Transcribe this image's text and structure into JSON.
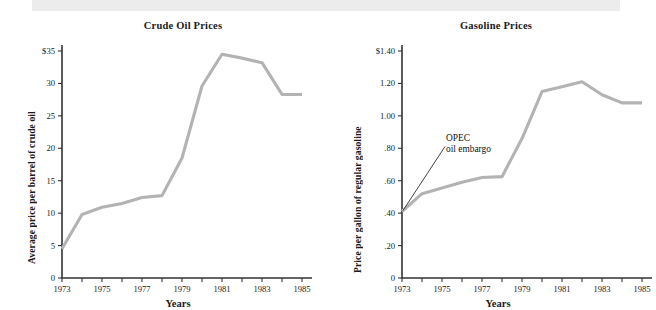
{
  "figure": {
    "background_color": "#ffffff",
    "band_color": "#ececec",
    "line_color": "#b3b3b3",
    "axis_color": "#333333"
  },
  "charts": [
    {
      "id": "crude-oil-prices",
      "title": "Crude Oil Prices",
      "xlabel": "Years",
      "ylabel": "Average price per barrel of crude oil",
      "ytick_labels": [
        "0",
        "5",
        "10",
        "15",
        "20",
        "25",
        "30",
        "$35"
      ],
      "xtick_labels": [
        "1973",
        "1975",
        "1977",
        "1979",
        "1981",
        "1983",
        "1985"
      ]
    },
    {
      "id": "gasoline-prices",
      "title": "Gasoline Prices",
      "xlabel": "Years",
      "ylabel": "Price per gallon of regular gasoline",
      "ytick_labels": [
        "0",
        ".20",
        ".40",
        ".60",
        ".80",
        "1.00",
        "1.20",
        "$1.40"
      ],
      "xtick_labels": [
        "1973",
        "1975",
        "1977",
        "1979",
        "1981",
        "1983",
        "1985"
      ],
      "annotation": {
        "line1": "OPEC",
        "line2": "oil embargo"
      }
    }
  ],
  "chart_data": [
    {
      "type": "line",
      "title": "Crude Oil Prices",
      "xlabel": "Years",
      "ylabel": "Average price per barrel of crude oil",
      "x": [
        1973,
        1974,
        1975,
        1976,
        1977,
        1978,
        1979,
        1980,
        1981,
        1982,
        1983,
        1984,
        1985
      ],
      "xtick_labels": [
        "1973",
        "1975",
        "1977",
        "1979",
        "1981",
        "1983",
        "1985"
      ],
      "xticks_all": [
        1973,
        1974,
        1975,
        1976,
        1977,
        1978,
        1979,
        1980,
        1981,
        1982,
        1983,
        1984,
        1985
      ],
      "values": [
        4.5,
        9.8,
        10.9,
        11.5,
        12.4,
        12.7,
        18.5,
        29.6,
        34.5,
        33.9,
        33.2,
        28.3,
        28.3
      ],
      "yticks": [
        0,
        5,
        10,
        15,
        20,
        25,
        30,
        35
      ],
      "ytick_labels": [
        "0",
        "5",
        "10",
        "15",
        "20",
        "25",
        "30",
        "$35"
      ],
      "xlim": [
        1973,
        1985
      ],
      "ylim": [
        0,
        35
      ],
      "grid": false,
      "legend": null,
      "units": "US dollars per barrel"
    },
    {
      "type": "line",
      "title": "Gasoline Prices",
      "xlabel": "Years",
      "ylabel": "Price per gallon of regular gasoline",
      "x": [
        1973,
        1974,
        1975,
        1976,
        1977,
        1978,
        1979,
        1980,
        1981,
        1982,
        1983,
        1984,
        1985
      ],
      "xtick_labels": [
        "1973",
        "1975",
        "1977",
        "1979",
        "1981",
        "1983",
        "1985"
      ],
      "xticks_all": [
        1973,
        1974,
        1975,
        1976,
        1977,
        1978,
        1979,
        1980,
        1981,
        1982,
        1983,
        1984,
        1985
      ],
      "values": [
        0.41,
        0.52,
        0.555,
        0.59,
        0.62,
        0.625,
        0.86,
        1.15,
        1.18,
        1.21,
        1.13,
        1.08,
        1.08
      ],
      "yticks": [
        0,
        0.2,
        0.4,
        0.6,
        0.8,
        1.0,
        1.2,
        1.4
      ],
      "ytick_labels": [
        "0",
        ".20",
        ".40",
        ".60",
        ".80",
        "1.00",
        "1.20",
        "$1.40"
      ],
      "xlim": [
        1973,
        1985
      ],
      "ylim": [
        0,
        1.4
      ],
      "grid": false,
      "legend": null,
      "units": "US dollars per gallon",
      "annotations": [
        {
          "text": "OPEC oil embargo",
          "points_to_x": 1973,
          "points_to_y": 0.41
        }
      ]
    }
  ]
}
